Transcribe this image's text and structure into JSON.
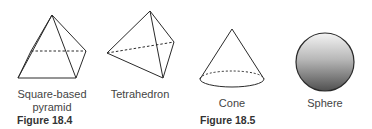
{
  "figures": [
    {
      "caption": "Figure 18.4",
      "shapes": [
        {
          "name": "square-based-pyramid",
          "label_line1": "Square-based",
          "label_line2": "pyramid"
        },
        {
          "name": "tetrahedron",
          "label_line1": "Tetrahedron"
        }
      ]
    },
    {
      "caption": "Figure 18.5",
      "shapes": [
        {
          "name": "cone",
          "label_line1": "Cone"
        },
        {
          "name": "sphere",
          "label_line1": "Sphere"
        }
      ]
    }
  ],
  "colors": {
    "line": "#2a2a2a",
    "sphere_top": "#f2f2f2",
    "sphere_bottom": "#555555"
  }
}
